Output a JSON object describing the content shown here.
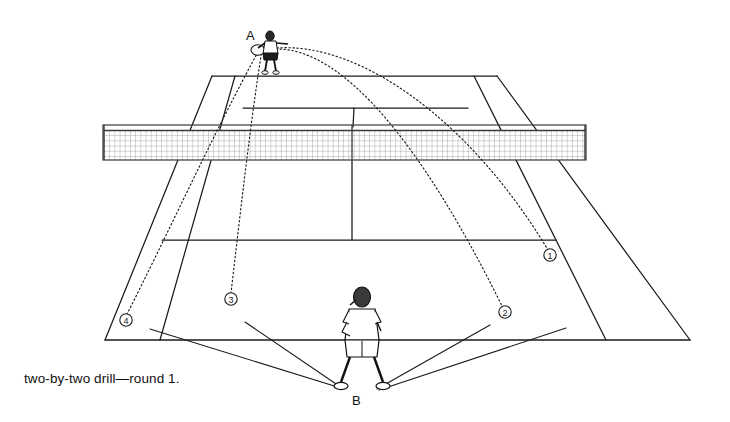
{
  "figure": {
    "caption": "two-by-two drill—round 1.",
    "width": 730,
    "height": 422,
    "background": "#ffffff",
    "line_color": "#1a1a1a",
    "net_color": "#5a5a5a"
  },
  "players": [
    {
      "id": "A",
      "label": "A",
      "role": "feeder",
      "position": {
        "x": 268,
        "y": 52
      },
      "label_position": {
        "x": 246,
        "y": 28
      },
      "holding_racket": true,
      "facing": "toward-camera"
    },
    {
      "id": "B",
      "label": "B",
      "role": "worker",
      "position": {
        "x": 362,
        "y": 330
      },
      "label_position": {
        "x": 352,
        "y": 393
      },
      "holding_racket": true,
      "facing": "away-from-camera"
    }
  ],
  "targets": [
    {
      "marker": "①",
      "number": 1,
      "x": 550,
      "y": 255,
      "zone": "deep-right"
    },
    {
      "marker": "②",
      "number": 2,
      "x": 505,
      "y": 312,
      "zone": "short-right"
    },
    {
      "marker": "③",
      "number": 3,
      "x": 231,
      "y": 299,
      "zone": "short-left"
    },
    {
      "marker": "④",
      "number": 4,
      "x": 126,
      "y": 320,
      "zone": "deep-left"
    }
  ],
  "ball_trajectories": [
    {
      "from": "A",
      "to": "①",
      "style": "dotted",
      "arc": "high"
    },
    {
      "from": "A",
      "to": "②",
      "style": "dotted",
      "arc": "high"
    },
    {
      "from": "A",
      "to": "③",
      "style": "dotted",
      "arc": "straight"
    },
    {
      "from": "A",
      "to": "④",
      "style": "dotted",
      "arc": "straight"
    }
  ],
  "run_paths": [
    {
      "from": "B",
      "to": "④",
      "style": "solid"
    },
    {
      "from": "B",
      "to": "③",
      "style": "solid"
    },
    {
      "from": "B",
      "to": "②",
      "style": "solid"
    },
    {
      "from": "B",
      "to": "①",
      "style": "solid"
    }
  ],
  "court": {
    "view": "perspective-from-behind-near-baseline",
    "net": {
      "left": 103,
      "right": 586,
      "top": 125,
      "bottom": 160
    },
    "far_baseline_y": 76,
    "far_service_line_y": 108,
    "near_service_line_y": 240,
    "near_baseline_y": 340
  }
}
